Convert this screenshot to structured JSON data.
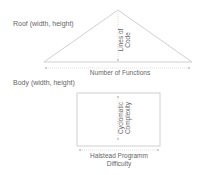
{
  "roof": {
    "title": "Roof (width, height)",
    "height_label_line1": "Lines of",
    "height_label_line2": "Code",
    "width_label": "Number of Functions"
  },
  "body": {
    "title": "Body (width, height)",
    "height_label_line1": "Cyclomatic",
    "height_label_line2": "Complexity",
    "width_label_line1": "Halstead Programm",
    "width_label_line2": "Difficulty"
  },
  "colors": {
    "stroke": "#d0d0d0",
    "text": "#666666"
  }
}
